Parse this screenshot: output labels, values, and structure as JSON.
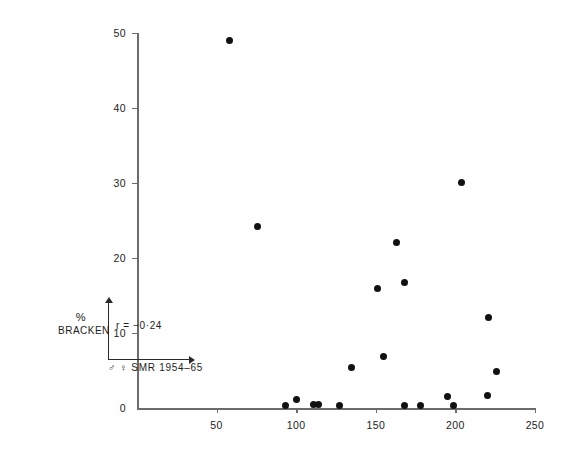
{
  "chart_data": {
    "type": "scatter",
    "title": "",
    "xlabel": "♂ ♀  SMR   1954–65",
    "ylabel": "% BRACKEN",
    "xlim": [
      0,
      255
    ],
    "ylim": [
      0,
      52
    ],
    "grid": false,
    "legend": null,
    "annotations": [
      {
        "name": "correlation",
        "text": "r = −0·24",
        "value": -0.24
      }
    ],
    "x_ticks": [
      50,
      100,
      150,
      200,
      250
    ],
    "y_ticks": [
      0,
      10,
      20,
      30,
      40,
      50
    ],
    "x_tick_labels": [
      "50",
      "100",
      "150",
      "200",
      "250"
    ],
    "y_tick_labels": [
      "0",
      "10",
      "20",
      "30",
      "40",
      "50"
    ],
    "marker": {
      "shape": "circle",
      "color": "#111111",
      "size": 7
    },
    "points": [
      {
        "x": 58,
        "y": 49.0
      },
      {
        "x": 76,
        "y": 24.2
      },
      {
        "x": 93,
        "y": 0.3
      },
      {
        "x": 100,
        "y": 1.2
      },
      {
        "x": 111,
        "y": 0.5
      },
      {
        "x": 114,
        "y": 0.5
      },
      {
        "x": 127,
        "y": 0.3
      },
      {
        "x": 135,
        "y": 5.4
      },
      {
        "x": 151,
        "y": 15.9
      },
      {
        "x": 155,
        "y": 6.9
      },
      {
        "x": 163,
        "y": 22.1
      },
      {
        "x": 168,
        "y": 0.4
      },
      {
        "x": 168,
        "y": 16.7
      },
      {
        "x": 178,
        "y": 0.4
      },
      {
        "x": 195,
        "y": 1.5
      },
      {
        "x": 199,
        "y": 0.3
      },
      {
        "x": 204,
        "y": 30.1
      },
      {
        "x": 220,
        "y": 1.7
      },
      {
        "x": 221,
        "y": 12.1
      },
      {
        "x": 226,
        "y": 4.9
      }
    ]
  }
}
